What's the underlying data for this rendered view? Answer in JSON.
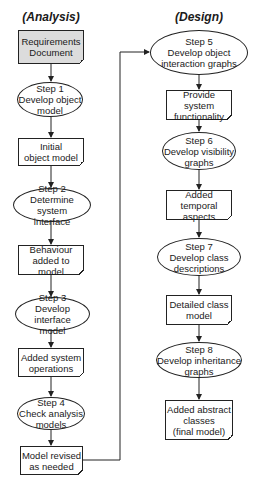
{
  "columns": {
    "analysis": {
      "title": "(Analysis)",
      "nodes": [
        {
          "type": "document",
          "label": [
            "Requirements",
            "Document"
          ],
          "fill": "#dcdcdc"
        },
        {
          "type": "process",
          "label": [
            "Step 1",
            "Develop object",
            "model"
          ]
        },
        {
          "type": "document",
          "label": [
            "Initial",
            "object model"
          ]
        },
        {
          "type": "process",
          "label": [
            "Step 2",
            "Determine system",
            "interface"
          ]
        },
        {
          "type": "document",
          "label": [
            "Behaviour",
            "added to model"
          ]
        },
        {
          "type": "process",
          "label": [
            "Step 3",
            "Develop interface",
            "model"
          ]
        },
        {
          "type": "document",
          "label": [
            "Added system",
            "operations"
          ]
        },
        {
          "type": "process",
          "label": [
            "Step 4",
            "Check analysis",
            "models"
          ]
        },
        {
          "type": "document",
          "label": [
            "Model revised",
            "as needed"
          ]
        }
      ]
    },
    "design": {
      "title": "(Design)",
      "nodes": [
        {
          "type": "process",
          "label": [
            "Step 5",
            "Develop object",
            "interaction graphs"
          ]
        },
        {
          "type": "document",
          "label": [
            "Provide system",
            "functionality"
          ]
        },
        {
          "type": "process",
          "label": [
            "Step 6",
            "Develop visibility",
            "graphs"
          ]
        },
        {
          "type": "document",
          "label": [
            "Added temporal",
            "aspects"
          ]
        },
        {
          "type": "process",
          "label": [
            "Step 7",
            "Develop class",
            "descriptions"
          ]
        },
        {
          "type": "document",
          "label": [
            "Detailed class",
            "model"
          ]
        },
        {
          "type": "process",
          "label": [
            "Step 8",
            "Develop inheritance",
            "graphs"
          ]
        },
        {
          "type": "document",
          "label": [
            "Added abstract",
            "classes",
            "(final model)"
          ]
        }
      ]
    }
  },
  "connections": [
    {
      "from": "Model revised as needed",
      "to": "Step 5 Develop object interaction graphs"
    }
  ]
}
